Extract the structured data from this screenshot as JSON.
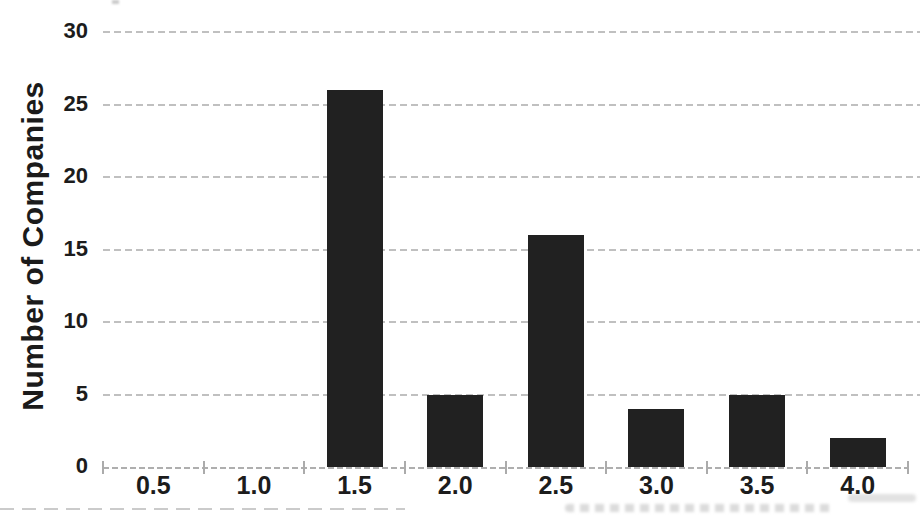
{
  "chart_data": {
    "type": "bar",
    "categories": [
      "0.5",
      "1.0",
      "1.5",
      "2.0",
      "2.5",
      "3.0",
      "3.5",
      "4.0"
    ],
    "values": [
      0,
      0,
      26,
      5,
      16,
      4,
      5,
      2
    ],
    "title": "",
    "xlabel": "",
    "ylabel": "Number of Companies",
    "ylim": [
      0,
      30
    ],
    "yticks": [
      0,
      5,
      10,
      15,
      20,
      25,
      30
    ],
    "grid": "horizontal-dashed",
    "legend": "none",
    "bar_color": "#212121",
    "gridline_color": "#b9b9b9",
    "axis_color": "#aaaaaa",
    "text_color": "#1c1c1c"
  }
}
